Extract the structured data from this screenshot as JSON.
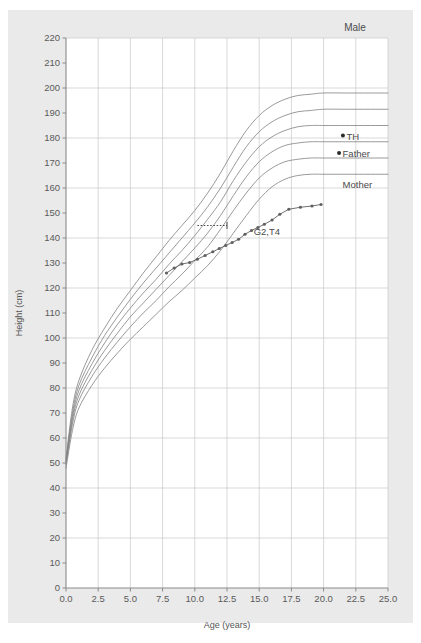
{
  "panel": {
    "title": "Male",
    "background_color": "#eaeaea",
    "plot_background_color": "#ffffff"
  },
  "axes": {
    "x_title": "Age (years)",
    "y_title": "Height (cm)",
    "x_ticks": [
      "0.0",
      "2.5",
      "5.0",
      "7.5",
      "10.0",
      "12.5",
      "15.0",
      "17.5",
      "20.0",
      "22.5",
      "25.0"
    ],
    "y_ticks": [
      "0",
      "10",
      "20",
      "30",
      "40",
      "50",
      "60",
      "70",
      "80",
      "90",
      "100",
      "110",
      "120",
      "130",
      "140",
      "150",
      "160",
      "170",
      "180",
      "190",
      "200",
      "210",
      "220"
    ],
    "grid": "on",
    "grid_color": "#c8c8c8",
    "axis_color": "#8a8a8a"
  },
  "annotations": [
    {
      "name": "TH",
      "label": "TH",
      "age": 21.5,
      "height": 181.0,
      "marker": "dot"
    },
    {
      "name": "Father",
      "label": "Father",
      "age": 21.2,
      "height": 174.0,
      "marker": "dot"
    },
    {
      "name": "Mother",
      "label": "Mother",
      "age": 21.2,
      "height": 161.5,
      "marker": "none"
    },
    {
      "name": "patient",
      "label": "G2,T4",
      "age": 14.3,
      "height": 143.0,
      "marker": "none"
    }
  ],
  "chart_data": {
    "type": "line",
    "title": "Male",
    "xlabel": "Age (years)",
    "ylabel": "Height (cm)",
    "xlim": [
      0.0,
      25.0
    ],
    "ylim": [
      0,
      220
    ],
    "xticks": [
      0.0,
      2.5,
      5.0,
      7.5,
      10.0,
      12.5,
      15.0,
      17.5,
      20.0,
      22.5,
      25.0
    ],
    "yticks": [
      0,
      10,
      20,
      30,
      40,
      50,
      60,
      70,
      80,
      90,
      100,
      110,
      120,
      130,
      140,
      150,
      160,
      170,
      180,
      190,
      200,
      210,
      220
    ],
    "grid": true,
    "legend": "none",
    "series": [
      {
        "name": "reference-97th",
        "style": "solid",
        "color": "#808080",
        "x": [
          0.0,
          0.5,
          1.0,
          2.0,
          3.0,
          4.0,
          5.0,
          6.0,
          7.0,
          8.0,
          9.0,
          10.0,
          11.0,
          12.0,
          13.0,
          14.0,
          15.0,
          16.0,
          17.0,
          18.0,
          19.0,
          20.0,
          22.0,
          25.0
        ],
        "y": [
          52.0,
          72.0,
          83.0,
          95.0,
          104.0,
          112.0,
          119.0,
          126.0,
          132.5,
          139.0,
          145.0,
          151.0,
          158.0,
          166.0,
          175.0,
          183.0,
          189.0,
          193.0,
          195.5,
          197.0,
          197.5,
          198.0,
          198.0,
          198.0
        ]
      },
      {
        "name": "reference-90th",
        "style": "solid",
        "color": "#808080",
        "x": [
          0.0,
          0.5,
          1.0,
          2.0,
          3.0,
          4.0,
          5.0,
          6.0,
          7.0,
          8.0,
          9.0,
          10.0,
          11.0,
          12.0,
          13.0,
          14.0,
          15.0,
          16.0,
          17.0,
          18.0,
          19.0,
          20.0,
          22.0,
          25.0
        ],
        "y": [
          51.0,
          70.0,
          81.0,
          92.0,
          101.0,
          108.5,
          115.5,
          122.0,
          128.0,
          134.0,
          140.0,
          146.0,
          152.5,
          160.0,
          168.5,
          176.5,
          182.5,
          186.5,
          189.0,
          190.5,
          191.0,
          191.5,
          191.5,
          191.5
        ]
      },
      {
        "name": "reference-75th",
        "style": "solid",
        "color": "#808080",
        "x": [
          0.0,
          0.5,
          1.0,
          2.0,
          3.0,
          4.0,
          5.0,
          6.0,
          7.0,
          8.0,
          9.0,
          10.0,
          11.0,
          12.0,
          13.0,
          14.0,
          15.0,
          16.0,
          17.0,
          18.0,
          19.0,
          20.0,
          22.0,
          25.0
        ],
        "y": [
          50.5,
          68.5,
          79.0,
          89.5,
          98.0,
          105.5,
          112.0,
          118.0,
          123.5,
          129.5,
          135.0,
          141.0,
          147.5,
          154.5,
          163.0,
          170.5,
          176.5,
          180.5,
          183.0,
          184.5,
          185.0,
          185.0,
          185.0,
          185.0
        ]
      },
      {
        "name": "reference-50th",
        "style": "solid",
        "color": "#808080",
        "x": [
          0.0,
          0.5,
          1.0,
          2.0,
          3.0,
          4.0,
          5.0,
          6.0,
          7.0,
          8.0,
          9.0,
          10.0,
          11.0,
          12.0,
          13.0,
          14.0,
          15.0,
          16.0,
          17.0,
          18.0,
          19.0,
          20.0,
          22.0,
          25.0
        ],
        "y": [
          50.0,
          67.0,
          77.0,
          87.0,
          95.0,
          102.0,
          108.5,
          114.0,
          119.5,
          125.0,
          130.5,
          136.0,
          142.0,
          149.0,
          157.0,
          164.5,
          170.5,
          174.5,
          177.0,
          178.0,
          178.5,
          178.5,
          178.5,
          178.5
        ]
      },
      {
        "name": "reference-25th",
        "style": "solid",
        "color": "#808080",
        "x": [
          0.0,
          0.5,
          1.0,
          2.0,
          3.0,
          4.0,
          5.0,
          6.0,
          7.0,
          8.0,
          9.0,
          10.0,
          11.0,
          12.0,
          13.0,
          14.0,
          15.0,
          16.0,
          17.0,
          18.0,
          19.0,
          20.0,
          22.0,
          25.0
        ],
        "y": [
          49.5,
          65.5,
          75.0,
          84.5,
          92.0,
          98.5,
          104.5,
          110.0,
          115.0,
          120.5,
          125.5,
          131.0,
          136.5,
          143.5,
          151.0,
          158.0,
          164.0,
          168.0,
          170.5,
          171.5,
          172.0,
          172.0,
          172.0,
          172.0
        ]
      },
      {
        "name": "reference-3rd",
        "style": "solid",
        "color": "#808080",
        "x": [
          0.0,
          0.5,
          1.0,
          2.0,
          3.0,
          4.0,
          5.0,
          6.0,
          7.0,
          8.0,
          9.0,
          10.0,
          11.0,
          12.0,
          13.0,
          14.0,
          15.0,
          16.0,
          17.0,
          18.0,
          19.0,
          20.0,
          22.0,
          25.0
        ],
        "y": [
          48.0,
          63.0,
          72.0,
          81.0,
          88.0,
          94.0,
          99.5,
          104.5,
          109.5,
          114.5,
          119.0,
          124.0,
          129.0,
          135.0,
          142.0,
          149.0,
          155.5,
          160.5,
          163.5,
          165.0,
          165.5,
          165.5,
          165.5,
          165.5
        ]
      },
      {
        "name": "patient-measurements",
        "style": "solid-with-markers",
        "color": "#606060",
        "x": [
          7.8,
          8.4,
          9.0,
          9.6,
          10.2,
          10.8,
          11.4,
          11.9,
          12.4,
          12.9,
          13.4,
          13.9,
          14.4,
          14.9,
          15.4,
          16.0,
          16.6,
          17.3,
          18.2,
          19.1,
          19.8
        ],
        "y": [
          126.0,
          128.0,
          129.6,
          130.2,
          131.5,
          133.0,
          134.5,
          135.8,
          137.0,
          138.2,
          139.5,
          141.5,
          143.0,
          144.2,
          145.5,
          147.2,
          149.5,
          151.5,
          152.3,
          152.8,
          153.4
        ]
      }
    ],
    "reference_line": {
      "name": "target-height-guide",
      "style": "dotted",
      "y": 145.0,
      "x_start": 10.2,
      "x_end": 12.5
    }
  }
}
